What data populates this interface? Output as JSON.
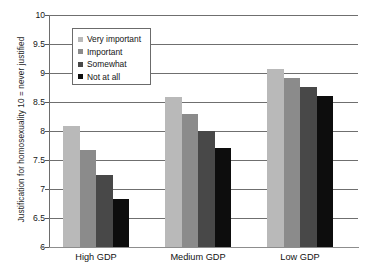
{
  "chart_data": {
    "type": "bar",
    "title": "",
    "xlabel": "",
    "ylabel": "Justification for homosexuality 10 = never justified",
    "categories": [
      "High GDP",
      "Medium GDP",
      "Low GDP"
    ],
    "series": [
      {
        "name": "Very important",
        "color": "#b9b9b9",
        "values": [
          8.08,
          8.58,
          9.07
        ]
      },
      {
        "name": "Important",
        "color": "#8b8b8b",
        "values": [
          7.67,
          8.29,
          8.92
        ]
      },
      {
        "name": "Somewhat",
        "color": "#484848",
        "values": [
          7.25,
          8.0,
          8.76
        ]
      },
      {
        "name": "Not at all",
        "color": "#0d0d0d",
        "values": [
          6.83,
          7.71,
          8.6
        ]
      }
    ],
    "ylim": [
      6,
      10
    ],
    "ytick_labels": [
      "10",
      "9.5",
      "9",
      "8.5",
      "8",
      "7.5",
      "7",
      "6.5",
      "6"
    ],
    "ytick_values": [
      10,
      9.5,
      9,
      8.5,
      8,
      7.5,
      7,
      6.5,
      6
    ],
    "grid": true,
    "legend_position": "upper-left-inside"
  }
}
